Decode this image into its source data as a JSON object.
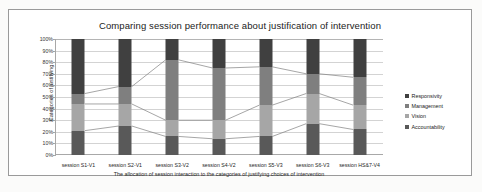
{
  "chart_data": {
    "type": "bar",
    "stacked": true,
    "stacked_percent": true,
    "title": "Comparing session performance about justification of intervention",
    "xlabel": "The allocation of session interaction to the categories of justifying choices of  intervention",
    "ylabel": "Categories of justifying",
    "ylim": [
      0,
      100
    ],
    "ytick_labels": [
      "100%",
      "90%",
      "80%",
      "70%",
      "60%",
      "50%",
      "40%",
      "30%",
      "20%",
      "10%",
      "0%"
    ],
    "ytick_values": [
      100,
      90,
      80,
      70,
      60,
      50,
      40,
      30,
      20,
      10,
      0
    ],
    "grid": true,
    "legend_position": "right",
    "categories": [
      "session S1-V1",
      "session S2-V1",
      "session S3-V2",
      "session S4-V2",
      "session S5-V3",
      "session S6-V3",
      "session HS&7-V4"
    ],
    "series": [
      {
        "name": "Accountability",
        "color": "#595959",
        "values": [
          21,
          25,
          16,
          14,
          16,
          27,
          22
        ]
      },
      {
        "name": "Vision",
        "color": "#a6a6a6",
        "values": [
          23,
          19,
          14,
          16,
          27,
          26,
          21
        ]
      },
      {
        "name": "Management",
        "color": "#7f7f7f",
        "values": [
          9,
          15,
          52,
          45,
          33,
          17,
          24
        ]
      },
      {
        "name": "Responsivity",
        "color": "#404040",
        "values": [
          47,
          41,
          18,
          25,
          24,
          30,
          33
        ]
      }
    ],
    "cumulative_boundaries": [
      [
        21,
        44,
        53
      ],
      [
        25,
        44,
        59
      ],
      [
        16,
        30,
        82
      ],
      [
        14,
        30,
        75
      ],
      [
        16,
        43,
        76
      ],
      [
        27,
        53,
        70
      ],
      [
        22,
        43,
        67
      ]
    ]
  },
  "legend": {
    "items": [
      {
        "label": "Responsivity",
        "color": "#404040"
      },
      {
        "label": "Management",
        "color": "#7f7f7f"
      },
      {
        "label": "Vision",
        "color": "#a6a6a6"
      },
      {
        "label": "Accountability",
        "color": "#595959"
      }
    ]
  }
}
